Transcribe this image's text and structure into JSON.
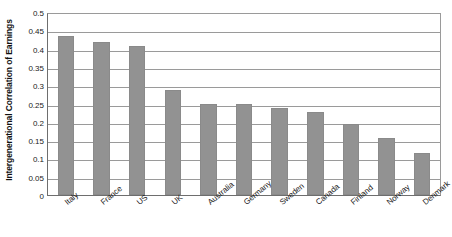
{
  "chart_data": {
    "type": "bar",
    "title": "",
    "xlabel": "",
    "ylabel": "Intergenerational Correlation of Earnings",
    "ylim": [
      0,
      0.5
    ],
    "ytick_labels": [
      "0.5",
      "0.45",
      "0.4",
      "0.35",
      "0.3",
      "0.25",
      "0.2",
      "0.15",
      "0.1",
      "0.05",
      "0"
    ],
    "ytick_values": [
      0.5,
      0.45,
      0.4,
      0.35,
      0.3,
      0.25,
      0.2,
      0.15,
      0.1,
      0.05,
      0
    ],
    "grid": true,
    "legend": "none",
    "bar_color": "#929292",
    "categories": [
      "Italy",
      "France",
      "US",
      "UK",
      "Australia",
      "Germany",
      "Sweden",
      "Canada",
      "Finland",
      "Norway",
      "Denmark"
    ],
    "values": [
      0.435,
      0.418,
      0.408,
      0.288,
      0.248,
      0.248,
      0.238,
      0.227,
      0.195,
      0.156,
      0.115
    ]
  }
}
